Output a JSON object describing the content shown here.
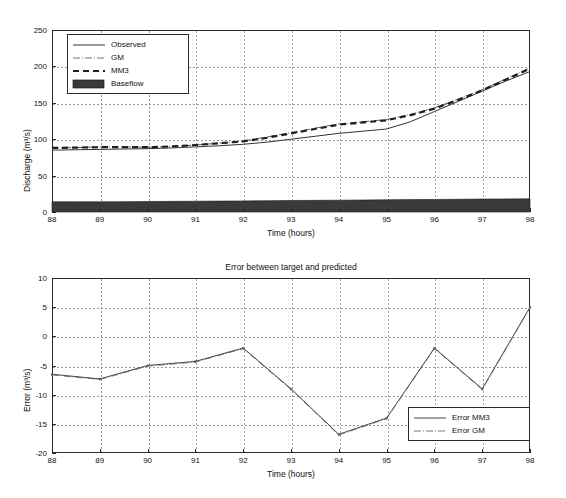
{
  "chart_data": [
    {
      "type": "line",
      "id": "hydrograph",
      "title": "",
      "xlabel": "Time (hours)",
      "ylabel": "Discharge (m³/s)",
      "xlim": [
        88,
        98
      ],
      "ylim": [
        0,
        250
      ],
      "xticks": [
        88,
        89,
        90,
        91,
        92,
        93,
        94,
        95,
        96,
        97,
        98
      ],
      "yticks": [
        0,
        50,
        100,
        150,
        200,
        250
      ],
      "grid": true,
      "legend_position": "top-left",
      "x": [
        88,
        88.5,
        89,
        89.5,
        90,
        90.5,
        91,
        91.5,
        92,
        92.5,
        93,
        93.5,
        94,
        94.5,
        95,
        95.5,
        96,
        96.5,
        97,
        97.5,
        98
      ],
      "series": [
        {
          "name": "Observed",
          "style": "solid",
          "color": "#333333",
          "values": [
            85,
            85.5,
            86,
            86.5,
            87,
            88,
            89.5,
            91,
            93,
            96,
            100,
            104,
            108,
            111,
            114,
            124,
            138,
            152,
            166,
            180,
            193
          ]
        },
        {
          "name": "GM",
          "style": "dashdot",
          "color": "#555555",
          "values": [
            88,
            88.5,
            89.5,
            89.5,
            89,
            90,
            92,
            94.5,
            97.5,
            103,
            109,
            115,
            121,
            124,
            127,
            134,
            143,
            155,
            168,
            183,
            198
          ]
        },
        {
          "name": "MM3",
          "style": "dashed",
          "color": "#1f1f1f",
          "values": [
            88,
            88.5,
            89,
            89,
            89,
            90,
            92,
            94.5,
            97,
            102,
            108,
            114,
            120,
            123,
            126,
            133,
            142,
            154,
            167,
            182,
            197
          ]
        },
        {
          "name": "Baseflow",
          "style": "patch",
          "color": "#3a3a3a",
          "values": [
            14,
            14,
            14,
            14.2,
            14.4,
            14.6,
            14.8,
            15,
            15.2,
            15.5,
            15.8,
            16,
            16.2,
            16.5,
            16.8,
            17,
            17.2,
            17.5,
            17.8,
            18,
            18.2
          ]
        }
      ]
    },
    {
      "type": "line",
      "id": "error",
      "title": "Error between target and predicted",
      "xlabel": "Time (hours)",
      "ylabel": "Error (m³/s)",
      "xlim": [
        88,
        98
      ],
      "ylim": [
        -20,
        10
      ],
      "xticks": [
        88,
        89,
        90,
        91,
        92,
        93,
        94,
        95,
        96,
        97,
        98
      ],
      "yticks": [
        10,
        5,
        0,
        -5,
        -10,
        -15,
        -20
      ],
      "grid": true,
      "legend_position": "bottom-right",
      "x": [
        88,
        89,
        90,
        91,
        92,
        93,
        94,
        95,
        96,
        97,
        98
      ],
      "series": [
        {
          "name": "Error MM3",
          "style": "solid",
          "color": "#444444",
          "values": [
            -6.5,
            -7.3,
            -5.0,
            -4.3,
            -2.0,
            -9.0,
            -16.8,
            -14.0,
            -2.0,
            -9.0,
            5.0
          ]
        },
        {
          "name": "Error GM",
          "style": "dashdot",
          "color": "#666666",
          "values": [
            -6.6,
            -7.4,
            -5.1,
            -4.4,
            -2.1,
            -9.1,
            -16.9,
            -14.1,
            -2.1,
            -9.1,
            4.9
          ]
        }
      ]
    }
  ],
  "upper": {
    "legend": [
      {
        "label": "Observed"
      },
      {
        "label": "GM"
      },
      {
        "label": "MM3"
      },
      {
        "label": "Baseflow"
      }
    ]
  },
  "lower": {
    "legend": [
      {
        "label": "Error MM3"
      },
      {
        "label": "Error GM"
      }
    ]
  }
}
